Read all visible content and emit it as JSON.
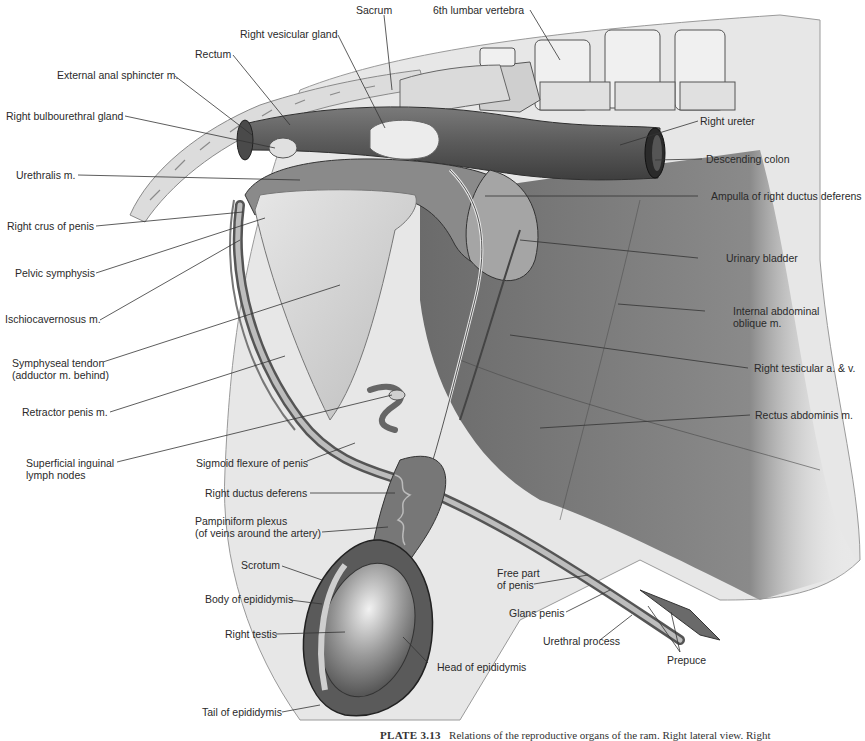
{
  "figure": {
    "caption_prefix": "PLATE 3.13",
    "caption_text": "Relations of the reproductive organs of the ram. Right lateral view. Right",
    "labels": {
      "sacrum": "Sacrum",
      "lumbar_vertebra": "6th lumbar vertebra",
      "right_vesicular_gland": "Right vesicular gland",
      "rectum": "Rectum",
      "external_anal_sphincter": "External anal sphincter m.",
      "right_bulbourethral_gland": "Right bulbourethral gland",
      "right_ureter": "Right ureter",
      "descending_colon": "Descending colon",
      "urethralis": "Urethralis m.",
      "ampulla": "Ampulla of right ductus deferens",
      "right_crus_of_penis": "Right crus of penis",
      "urinary_bladder": "Urinary bladder",
      "pelvic_symphysis": "Pelvic symphysis",
      "internal_abdominal_oblique_1": "Internal abdominal",
      "internal_abdominal_oblique_2": "oblique m.",
      "ischiocavernosus": "Ischiocavernosus m.",
      "symphyseal_tendon_1": "Symphyseal tendon",
      "symphyseal_tendon_2": "(adductor m. behind)",
      "right_testicular_av": "Right testicular a. & v.",
      "retractor_penis": "Retractor penis m.",
      "rectus_abdominis": "Rectus abdominis m.",
      "superficial_inguinal_1": "Superficial inguinal",
      "superficial_inguinal_2": "lymph nodes",
      "sigmoid_flexure": "Sigmoid flexure of penis",
      "right_ductus_deferens": "Right ductus deferens",
      "pampiniform_1": "Pampiniform plexus",
      "pampiniform_2": "(of veins around the artery)",
      "scrotum": "Scrotum",
      "body_of_epididymis": "Body of epididymis",
      "right_testis": "Right testis",
      "tail_of_epididymis": "Tail of epididymis",
      "head_of_epididymis": "Head of epididymis",
      "free_part_of_penis_1": "Free part",
      "free_part_of_penis_2": "of penis",
      "glans_penis": "Glans penis",
      "urethral_process": "Urethral process",
      "prepuce": "Prepuce"
    }
  }
}
